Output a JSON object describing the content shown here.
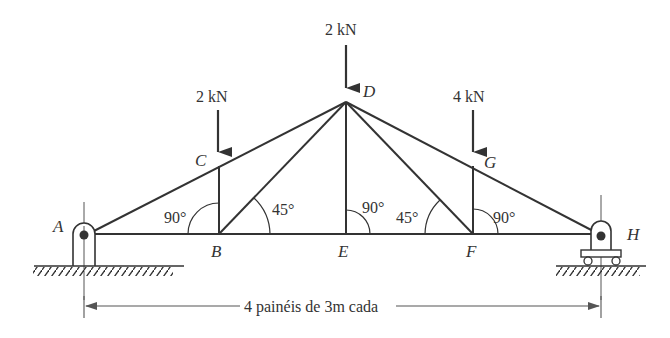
{
  "diagram": {
    "type": "truss",
    "nodes": {
      "A": {
        "label": "A"
      },
      "B": {
        "label": "B"
      },
      "C": {
        "label": "C"
      },
      "D": {
        "label": "D"
      },
      "E": {
        "label": "E"
      },
      "F": {
        "label": "F"
      },
      "G": {
        "label": "G"
      },
      "H": {
        "label": "H"
      }
    },
    "loads": [
      {
        "node": "C",
        "label": "2 kN"
      },
      {
        "node": "D",
        "label": "2 kN"
      },
      {
        "node": "G",
        "label": "4 kN"
      }
    ],
    "angles": [
      {
        "at": "B",
        "side": "left",
        "label": "90°"
      },
      {
        "at": "B",
        "side": "right",
        "label": "45°"
      },
      {
        "at": "E",
        "side": "right",
        "label": "90°"
      },
      {
        "at": "F",
        "side": "left",
        "label": "45°"
      },
      {
        "at": "F",
        "side": "right",
        "label": "90°"
      }
    ],
    "supports": [
      {
        "node": "A",
        "type": "pin"
      },
      {
        "node": "H",
        "type": "roller"
      }
    ],
    "dimension": {
      "label": "4 painéis de 3m cada"
    },
    "colors": {
      "line": "#333333",
      "background": "#ffffff"
    }
  }
}
